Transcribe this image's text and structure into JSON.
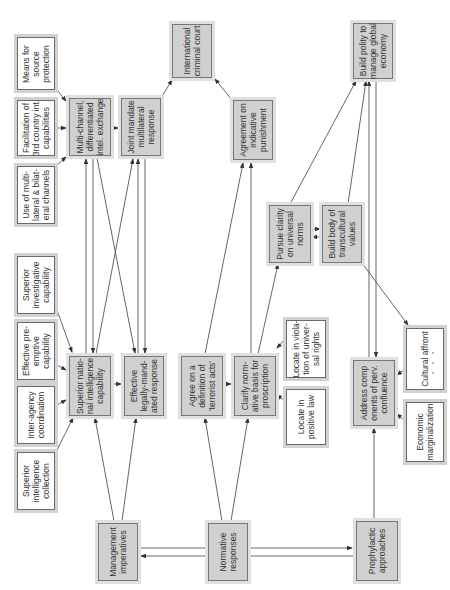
{
  "diagram": {
    "orientation": "rotated 90 degrees counter-clockwise",
    "colors": {
      "primary_node_fill": "#d0d0d0",
      "secondary_node_fill": "#ffffff",
      "edge": "#444444"
    },
    "nodes": {
      "means_source": {
        "label": "Means for\nsource\nprotection",
        "style": "white"
      },
      "facilitation": {
        "label": "Facilitation of\n3rd country int.\ncapabilities",
        "style": "white"
      },
      "use_multilateral": {
        "label": "Use of multi-\nlateral & bilat-\neral channels",
        "style": "white"
      },
      "multichannel": {
        "label": "Multi-channel,\ndifferentiated\nintel. exchange",
        "style": "grey"
      },
      "joint_mandate": {
        "label": "Joint mandate\nmultilateral\nresponse",
        "style": "grey"
      },
      "icc": {
        "label": "International\ncriminal court",
        "style": "grey"
      },
      "agreement_punishment": {
        "label": "Agreement on\nindicative\npunishment",
        "style": "grey"
      },
      "build_polity": {
        "label": "Build polity to\nmanage global\neconomy",
        "style": "grey"
      },
      "pursue_clarity": {
        "label": "Pursue clarity\non universal\nnorms",
        "style": "grey"
      },
      "build_body": {
        "label": "Build body of\ntranscultural\nvalues",
        "style": "grey"
      },
      "superior_investigative": {
        "label": "Superior\ninvestigative\ncapability",
        "style": "white"
      },
      "effective_preemptive": {
        "label": "Effective pre-\nemptive\ncapability",
        "style": "white"
      },
      "interagency": {
        "label": "Inter-agency\ncoordination",
        "style": "white"
      },
      "superior_collection": {
        "label": "Superior\nintelligence\ncollection",
        "style": "white"
      },
      "superior_national": {
        "label": "Superior natio-\nnal intelligence\ncapability",
        "style": "grey"
      },
      "effective_legal": {
        "label": "Effective\nlegally-mand-\nated response",
        "style": "grey"
      },
      "agree_definition": {
        "label": "Agree on a\ndefinition of\n'terrorist acts'",
        "style": "grey"
      },
      "clarify_normative": {
        "label": "Clarify norm-\native basis for\nproscription",
        "style": "grey"
      },
      "locate_violation": {
        "label": "Locate in viola-\ntion of univer-\nsal rights",
        "style": "white"
      },
      "locate_positive": {
        "label": "Locate in\npositive law",
        "style": "white"
      },
      "address_components": {
        "label": "Address comp\nonents of perv.\nconfluence",
        "style": "grey"
      },
      "cultural_affront": {
        "label": "Cultural affront",
        "style": "white"
      },
      "economic_marginalization": {
        "label": "Economic\nmarginalization",
        "style": "white"
      },
      "management": {
        "label": "Management\nimperatives",
        "style": "grey"
      },
      "normative": {
        "label": "Normative\nresponses",
        "style": "grey"
      },
      "prophylactic": {
        "label": "Prophylactic\napproaches",
        "style": "grey"
      }
    },
    "edges": [
      [
        "means_source",
        "multichannel"
      ],
      [
        "facilitation",
        "multichannel"
      ],
      [
        "use_multilateral",
        "multichannel"
      ],
      [
        "multichannel",
        "joint_mandate"
      ],
      [
        "joint_mandate",
        "icc"
      ],
      [
        "agreement_punishment",
        "icc"
      ],
      [
        "superior_investigative",
        "superior_national"
      ],
      [
        "effective_preemptive",
        "superior_national"
      ],
      [
        "interagency",
        "superior_national"
      ],
      [
        "superior_collection",
        "superior_national"
      ],
      [
        "superior_national",
        "effective_legal"
      ],
      [
        "superior_national",
        "multichannel"
      ],
      [
        "multichannel",
        "superior_national"
      ],
      [
        "multichannel",
        "effective_legal"
      ],
      [
        "superior_national",
        "joint_mandate"
      ],
      [
        "effective_legal",
        "joint_mandate"
      ],
      [
        "joint_mandate",
        "effective_legal"
      ],
      [
        "agree_definition",
        "clarify_normative"
      ],
      [
        "agree_definition",
        "agreement_punishment"
      ],
      [
        "clarify_normative",
        "agreement_punishment"
      ],
      [
        "clarify_normative",
        "pursue_clarity"
      ],
      [
        "locate_violation",
        "clarify_normative"
      ],
      [
        "locate_positive",
        "clarify_normative"
      ],
      [
        "pursue_clarity",
        "build_polity"
      ],
      [
        "pursue_clarity",
        "build_body"
      ],
      [
        "build_body",
        "pursue_clarity"
      ],
      [
        "build_body",
        "build_polity"
      ],
      [
        "build_body",
        "cultural_affront"
      ],
      [
        "address_components",
        "build_polity"
      ],
      [
        "build_polity",
        "address_components"
      ],
      [
        "cultural_affront",
        "address_components"
      ],
      [
        "economic_marginalization",
        "address_components"
      ],
      [
        "management",
        "superior_national"
      ],
      [
        "management",
        "effective_legal"
      ],
      [
        "normative",
        "agree_definition"
      ],
      [
        "normative",
        "clarify_normative"
      ],
      [
        "normative",
        "management"
      ],
      [
        "normative",
        "prophylactic"
      ],
      [
        "prophylactic",
        "address_components"
      ]
    ]
  }
}
